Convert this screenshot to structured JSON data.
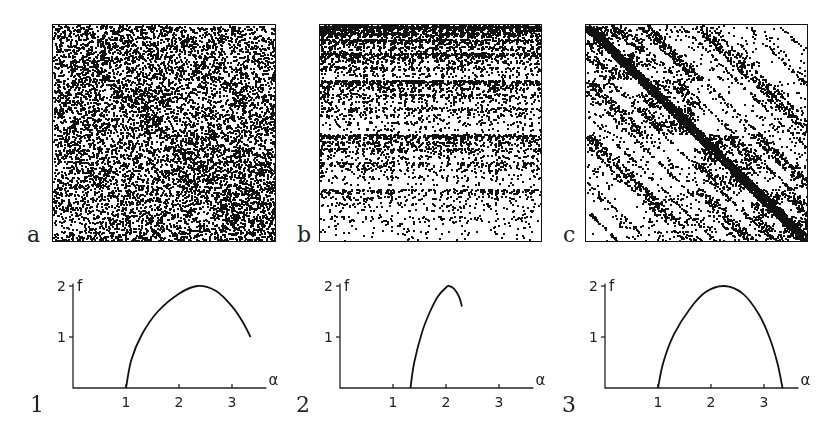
{
  "figure": {
    "scatter_panels": [
      {
        "id": "a",
        "label": "a",
        "pattern": "uniform-multifractal",
        "frame": {
          "left": 52,
          "top": 24,
          "width": 224,
          "height": 218
        }
      },
      {
        "id": "b",
        "label": "b",
        "pattern": "horizontal-bands-triangles",
        "frame": {
          "left": 319,
          "top": 24,
          "width": 223,
          "height": 218
        }
      },
      {
        "id": "c",
        "label": "c",
        "pattern": "diagonal-streaks",
        "frame": {
          "left": 585,
          "top": 24,
          "width": 223,
          "height": 218
        }
      }
    ],
    "spectrum_panels": [
      {
        "id": "1",
        "label": "1",
        "origin": {
          "x": 73,
          "y": 388
        }
      },
      {
        "id": "2",
        "label": "2",
        "origin": {
          "x": 340,
          "y": 388
        }
      },
      {
        "id": "3",
        "label": "3",
        "origin": {
          "x": 605,
          "y": 388
        }
      }
    ],
    "colors": {
      "ink": "#111111",
      "background": "#ffffff"
    }
  },
  "chart_data": [
    {
      "type": "line",
      "panel": "1",
      "title": "",
      "xlabel": "α",
      "ylabel": "f",
      "xticks": [
        "1",
        "2",
        "3"
      ],
      "yticks": [
        "1",
        "2"
      ],
      "xlim": [
        0,
        3.7
      ],
      "ylim": [
        0,
        2
      ],
      "grid": false,
      "series": [
        {
          "name": "f(α)",
          "x": [
            1.0,
            1.1,
            1.3,
            1.6,
            2.0,
            2.35,
            2.7,
            3.0,
            3.2,
            3.35
          ],
          "y": [
            0.0,
            0.55,
            1.05,
            1.5,
            1.85,
            2.0,
            1.9,
            1.6,
            1.3,
            1.0
          ]
        }
      ]
    },
    {
      "type": "line",
      "panel": "2",
      "title": "",
      "xlabel": "α",
      "ylabel": "f",
      "xticks": [
        "1",
        "2",
        "3"
      ],
      "yticks": [
        "1",
        "2"
      ],
      "xlim": [
        0,
        3.7
      ],
      "ylim": [
        0,
        2
      ],
      "grid": false,
      "series": [
        {
          "name": "f(α)",
          "x": [
            1.33,
            1.4,
            1.55,
            1.7,
            1.85,
            2.0,
            2.05,
            2.15,
            2.25,
            2.3
          ],
          "y": [
            0.0,
            0.5,
            1.1,
            1.5,
            1.8,
            1.97,
            2.0,
            1.95,
            1.78,
            1.6
          ]
        }
      ]
    },
    {
      "type": "line",
      "panel": "3",
      "title": "",
      "xlabel": "α",
      "ylabel": "f",
      "xticks": [
        "1",
        "2",
        "3"
      ],
      "yticks": [
        "1",
        "2"
      ],
      "xlim": [
        0,
        3.7
      ],
      "ylim": [
        0,
        2
      ],
      "grid": false,
      "series": [
        {
          "name": "f(α)",
          "x": [
            1.0,
            1.1,
            1.3,
            1.6,
            1.9,
            2.25,
            2.6,
            2.9,
            3.1,
            3.25,
            3.35
          ],
          "y": [
            0.0,
            0.5,
            1.05,
            1.55,
            1.88,
            2.0,
            1.85,
            1.45,
            1.0,
            0.5,
            0.0
          ]
        }
      ]
    }
  ]
}
